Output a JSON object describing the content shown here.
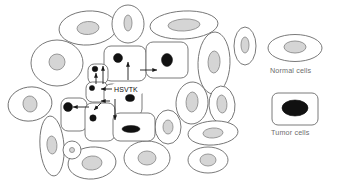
{
  "figure": {
    "name": "hsvtk-bystander-effect-diagram",
    "gene_label": "HSVTK",
    "colors": {
      "outline": "#6b6b6b",
      "outline_dark": "#3a3a3a",
      "normal_nucleus_fill": "#d5d5d5",
      "normal_nucleus_stroke": "#8a8a8a",
      "tumor_nucleus_fill": "#111111",
      "arrow": "#1a1a1a",
      "text": "#6d6d6d",
      "background": "#ffffff"
    }
  },
  "legend": {
    "items": [
      {
        "label": "Normal cells",
        "shape": "ellipse",
        "nucleus": "light-gray"
      },
      {
        "label": "Tumor cells",
        "shape": "rounded-rect",
        "nucleus": "black"
      }
    ]
  },
  "cells": {
    "normal": [
      {
        "cx": 88,
        "cy": 28,
        "rx": 29,
        "ry": 17,
        "rot": -4,
        "nrx": 11,
        "nry": 6.5
      },
      {
        "cx": 128,
        "cy": 24,
        "rx": 16,
        "ry": 19,
        "rot": 0,
        "nrx": 4,
        "nry": 8
      },
      {
        "cx": 184,
        "cy": 25,
        "rx": 34,
        "ry": 14,
        "rot": -3,
        "nrx": 16,
        "nry": 6
      },
      {
        "cx": 57,
        "cy": 63,
        "rx": 26,
        "ry": 23,
        "rot": 0,
        "nrx": 8,
        "nry": 8
      },
      {
        "cx": 30,
        "cy": 104,
        "rx": 22,
        "ry": 17,
        "rot": -8,
        "nrx": 7,
        "nry": 8
      },
      {
        "cx": 214,
        "cy": 63,
        "rx": 16,
        "ry": 31,
        "rot": 2,
        "nrx": 6,
        "nry": 11
      },
      {
        "cx": 192,
        "cy": 103,
        "rx": 16,
        "ry": 21,
        "rot": 3,
        "nrx": 6,
        "nry": 10
      },
      {
        "cx": 222,
        "cy": 105,
        "rx": 13,
        "ry": 19,
        "rot": -4,
        "nrx": 5,
        "nry": 9
      },
      {
        "cx": 168,
        "cy": 127,
        "rx": 13,
        "ry": 17,
        "rot": 0,
        "nrx": 5,
        "nry": 7
      },
      {
        "cx": 213,
        "cy": 133,
        "rx": 25,
        "ry": 12,
        "rot": -4,
        "nrx": 10,
        "nry": 5
      },
      {
        "cx": 147,
        "cy": 158,
        "rx": 23,
        "ry": 17,
        "rot": 0,
        "nrx": 9,
        "nry": 7
      },
      {
        "cx": 92,
        "cy": 163,
        "rx": 24,
        "ry": 16,
        "rot": -5,
        "nrx": 10,
        "nry": 7
      },
      {
        "cx": 52,
        "cy": 146,
        "rx": 12,
        "ry": 30,
        "rot": -4,
        "nrx": 5,
        "nry": 9
      },
      {
        "cx": 72,
        "cy": 150,
        "rx": 9,
        "ry": 9,
        "rot": 0,
        "nrx": 2.5,
        "nry": 2.5
      },
      {
        "cx": 208,
        "cy": 160,
        "rx": 20,
        "ry": 13,
        "rot": 0,
        "nrx": 8,
        "nry": 6
      },
      {
        "cx": 245,
        "cy": 46,
        "rx": 11,
        "ry": 19,
        "rot": 0,
        "nrx": 4,
        "nry": 8
      }
    ],
    "tumor": [
      {
        "x": 104,
        "y": 46,
        "w": 42,
        "h": 35,
        "nx": 118,
        "ny": 58,
        "nrx": 4.5,
        "nry": 4.5
      },
      {
        "x": 146,
        "y": 42,
        "w": 42,
        "h": 36,
        "nx": 167,
        "ny": 60,
        "nrx": 5.5,
        "nry": 6.5
      },
      {
        "x": 88,
        "y": 64,
        "w": 20,
        "h": 20,
        "nx": 95,
        "ny": 69,
        "nrx": 2.8,
        "nry": 2.8
      },
      {
        "x": 86,
        "y": 82,
        "w": 22,
        "h": 20,
        "nx": 92,
        "ny": 88,
        "nrx": 2.6,
        "nry": 2.6
      },
      {
        "x": 104,
        "y": 84,
        "w": 38,
        "h": 32,
        "nx": 130,
        "ny": 98,
        "nrx": 4.5,
        "nry": 3.5
      },
      {
        "x": 61,
        "y": 98,
        "w": 26,
        "h": 33,
        "nx": 68,
        "ny": 107,
        "nrx": 4.5,
        "nry": 4.5
      },
      {
        "x": 85,
        "y": 103,
        "w": 30,
        "h": 38,
        "nx": 93,
        "ny": 118,
        "nrx": 3.2,
        "nry": 3.2
      },
      {
        "x": 113,
        "y": 113,
        "w": 42,
        "h": 28,
        "nx": 131,
        "ny": 129,
        "nrx": 9,
        "nry": 3.5
      }
    ]
  },
  "arrows": [
    {
      "name": "arrow-right-upper",
      "x1": 140,
      "y1": 70,
      "x2": 157,
      "y2": 70
    },
    {
      "name": "arrow-up-center",
      "x1": 128,
      "y1": 80,
      "x2": 128,
      "y2": 62
    },
    {
      "name": "arrow-up-left",
      "x1": 103,
      "y1": 84,
      "x2": 103,
      "y2": 66
    },
    {
      "name": "arrow-up-small",
      "x1": 96,
      "y1": 84,
      "x2": 96,
      "y2": 73
    },
    {
      "name": "arrow-left-mid",
      "x1": 112,
      "y1": 89,
      "x2": 101,
      "y2": 89
    },
    {
      "name": "arrow-left-lower",
      "x1": 110,
      "y1": 101,
      "x2": 101,
      "y2": 101
    },
    {
      "name": "arrow-down-center",
      "x1": 115,
      "y1": 99,
      "x2": 115,
      "y2": 120
    },
    {
      "name": "arrow-left-bottom",
      "x1": 89,
      "y1": 107,
      "x2": 73,
      "y2": 107
    },
    {
      "name": "arrow-down-left-lower",
      "x1": 101,
      "y1": 103,
      "x2": 94,
      "y2": 110
    }
  ]
}
